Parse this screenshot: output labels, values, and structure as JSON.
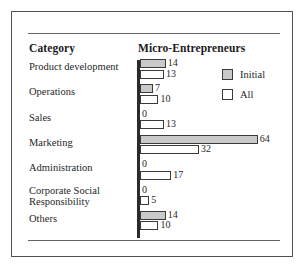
{
  "figure": {
    "category_header": "Category",
    "series_header": "Micro-Entrepreneurs"
  },
  "legend": {
    "position": "top-right",
    "entries": [
      {
        "label": "Initial",
        "swatch": "filled-gray-square",
        "color": "#c9c9c9"
      },
      {
        "label": "All",
        "swatch": "empty-white-square",
        "color": "#ffffff"
      }
    ]
  },
  "chart_data": {
    "type": "bar",
    "orientation": "horizontal",
    "title": "Micro-Entrepreneurs",
    "xlabel": "",
    "ylabel": "Category",
    "grid": false,
    "legend_position": "top-right",
    "xlim": [
      0,
      64
    ],
    "categories": [
      "Product development",
      "Operations",
      "Sales",
      "Marketing",
      "Administration",
      "Corporate Social Responsibility",
      "Others"
    ],
    "series": [
      {
        "name": "Initial",
        "color": "#c9c9c9",
        "values": [
          14,
          7,
          0,
          64,
          0,
          0,
          14
        ]
      },
      {
        "name": "All",
        "color": "#ffffff",
        "values": [
          13,
          10,
          13,
          32,
          17,
          5,
          10
        ]
      }
    ],
    "data_labels": [
      {
        "category": "Product development",
        "initial": "14",
        "all": "13"
      },
      {
        "category": "Operations",
        "initial": "7",
        "all": "10"
      },
      {
        "category": "Sales",
        "initial": "0",
        "all": "13"
      },
      {
        "category": "Marketing",
        "initial": "64",
        "all": "32"
      },
      {
        "category": "Administration",
        "initial": "0",
        "all": "17"
      },
      {
        "category": "Corporate Social Responsibility",
        "initial": "0",
        "all": "5"
      },
      {
        "category": "Others",
        "initial": "14",
        "all": "10"
      }
    ]
  },
  "rows": [
    {
      "label_line1": "Product development",
      "label_line2": "",
      "initial_value": 14,
      "initial_text": "14",
      "all_value": 13,
      "all_text": "13"
    },
    {
      "label_line1": "Operations",
      "label_line2": "",
      "initial_value": 7,
      "initial_text": "7",
      "all_value": 10,
      "all_text": "10"
    },
    {
      "label_line1": "Sales",
      "label_line2": "",
      "initial_value": 0,
      "initial_text": "0",
      "all_value": 13,
      "all_text": "13"
    },
    {
      "label_line1": "Marketing",
      "label_line2": "",
      "initial_value": 64,
      "initial_text": "64",
      "all_value": 32,
      "all_text": "32"
    },
    {
      "label_line1": "Administration",
      "label_line2": "",
      "initial_value": 0,
      "initial_text": "0",
      "all_value": 17,
      "all_text": "17"
    },
    {
      "label_line1": "Corporate Social",
      "label_line2": "Responsibility",
      "initial_value": 0,
      "initial_text": "0",
      "all_value": 5,
      "all_text": "5"
    },
    {
      "label_line1": "Others",
      "label_line2": "",
      "initial_value": 14,
      "initial_text": "14",
      "all_value": 10,
      "all_text": "10"
    }
  ]
}
